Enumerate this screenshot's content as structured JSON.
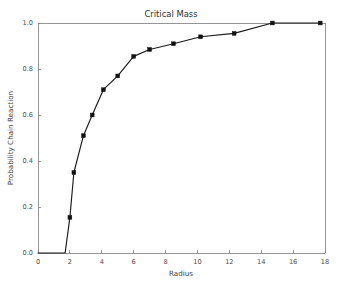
{
  "chart_data": {
    "type": "line",
    "title": "Critical Mass",
    "xlabel": "Radius",
    "ylabel": "Probability Chain Reaction",
    "xlim": [
      0,
      18
    ],
    "ylim": [
      0.0,
      1.0
    ],
    "xticks": [
      0,
      2,
      4,
      6,
      8,
      10,
      12,
      14,
      16,
      18
    ],
    "xticklabels": [
      "0",
      "2",
      "4",
      "6",
      "8",
      "10",
      "12",
      "14",
      "16",
      "18"
    ],
    "yticks": [
      0.0,
      0.2,
      0.4,
      0.6,
      0.8,
      1.0
    ],
    "yticklabels": [
      "0.0",
      "0.2",
      "0.4",
      "0.6",
      "0.8",
      "1.0"
    ],
    "grid": false,
    "legend": false,
    "marker": "square",
    "line_color": "#111111",
    "marker_color": "#111111",
    "background_color": "#ffffff",
    "frame_color": "#8a8a8a",
    "series": [
      {
        "name": "Probability Chain Reaction",
        "x": [
          0.0,
          0.6,
          1.2,
          1.7,
          2.0,
          2.25,
          2.85,
          3.4,
          4.1,
          5.0,
          6.0,
          7.0,
          8.5,
          10.2,
          12.3,
          14.7,
          17.7
        ],
        "values": [
          0.0,
          0.0,
          0.0,
          0.0,
          0.155,
          0.35,
          0.51,
          0.6,
          0.71,
          0.77,
          0.855,
          0.885,
          0.91,
          0.94,
          0.955,
          1.0,
          1.0
        ],
        "markers": [
          {
            "x": 2.0,
            "y": 0.155
          },
          {
            "x": 2.25,
            "y": 0.35
          },
          {
            "x": 2.85,
            "y": 0.51
          },
          {
            "x": 3.4,
            "y": 0.6
          },
          {
            "x": 4.1,
            "y": 0.71
          },
          {
            "x": 5.0,
            "y": 0.77
          },
          {
            "x": 6.0,
            "y": 0.855
          },
          {
            "x": 7.0,
            "y": 0.885
          },
          {
            "x": 8.5,
            "y": 0.91
          },
          {
            "x": 10.2,
            "y": 0.94
          },
          {
            "x": 12.3,
            "y": 0.955
          },
          {
            "x": 14.7,
            "y": 1.0
          },
          {
            "x": 17.7,
            "y": 1.0
          }
        ]
      }
    ]
  }
}
